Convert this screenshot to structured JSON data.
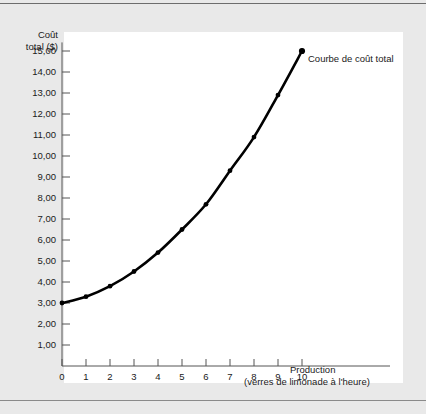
{
  "chart_data": {
    "type": "line",
    "title": "",
    "ylabel": "Coût total ($)",
    "ylabel_line1": "Coût",
    "ylabel_line2": "total ($)",
    "xlabel": "Production",
    "xlabel_sub": "(verres de limonade à l'heure)",
    "x": [
      0,
      1,
      2,
      3,
      4,
      5,
      6,
      7,
      8,
      9,
      10
    ],
    "values": [
      3.0,
      3.3,
      3.8,
      4.5,
      5.4,
      6.5,
      7.7,
      9.3,
      10.9,
      12.9,
      15.0
    ],
    "series": [
      {
        "name": "Courbe de coût total",
        "values": [
          3.0,
          3.3,
          3.8,
          4.5,
          5.4,
          6.5,
          7.7,
          9.3,
          10.9,
          12.9,
          15.0
        ]
      }
    ],
    "xtick_labels": [
      "0",
      "1",
      "2",
      "3",
      "4",
      "5",
      "6",
      "7",
      "8",
      "9",
      "10"
    ],
    "ytick_labels": [
      "1,00",
      "2,00",
      "3,00",
      "4,00",
      "5,00",
      "6,00",
      "7,00",
      "8,00",
      "9,00",
      "10,00",
      "11,00",
      "12,00",
      "13,00",
      "14,00",
      "15,00"
    ],
    "ytick_values": [
      1,
      2,
      3,
      4,
      5,
      6,
      7,
      8,
      9,
      10,
      11,
      12,
      13,
      14,
      15
    ],
    "xlim": [
      0,
      10
    ],
    "ylim": [
      0,
      15.6
    ],
    "grid": false,
    "legend_position": "inline-annotation",
    "annotations": [
      {
        "text": "Courbe de coût total",
        "x": 10,
        "y": 15.0
      }
    ],
    "colors": {
      "curve": "#000000",
      "marker": "#000000",
      "axis": "#555555",
      "panel_background": "#ffffff",
      "figure_background": "#e9e9e9",
      "text": "#1a1a1a"
    }
  }
}
